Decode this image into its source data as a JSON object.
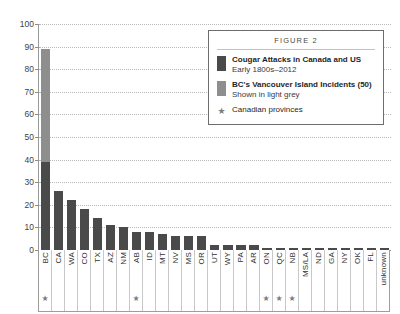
{
  "chart_data": {
    "type": "bar",
    "title": "",
    "xlabel": "",
    "ylabel": "",
    "ylim": [
      0,
      100
    ],
    "ytick_step": 10,
    "yticks": [
      0,
      10,
      20,
      30,
      40,
      50,
      60,
      70,
      80,
      90,
      100
    ],
    "grid": true,
    "legend_position": "upper-right",
    "categories": [
      "BC",
      "CA",
      "WA",
      "CO",
      "TX",
      "AZ",
      "NM",
      "AB",
      "ID",
      "MT",
      "NV",
      "MS",
      "OR",
      "UT",
      "WY",
      "PA",
      "AR",
      "ON",
      "QC",
      "NB",
      "MS/LA",
      "ND",
      "GA",
      "NY",
      "OK",
      "FL",
      "unknown"
    ],
    "values": [
      89,
      26,
      22,
      18,
      14,
      11,
      10,
      8,
      8,
      7,
      6,
      6,
      6,
      2,
      2,
      2,
      2,
      1,
      1,
      1,
      1,
      1,
      1,
      1,
      1,
      1,
      1
    ],
    "series": [
      {
        "name": "Cougar Attacks in Canada and US",
        "color": "#4a4a4a",
        "values": [
          39,
          26,
          22,
          18,
          14,
          11,
          10,
          8,
          8,
          7,
          6,
          6,
          6,
          2,
          2,
          2,
          2,
          1,
          1,
          1,
          1,
          1,
          1,
          1,
          1,
          1,
          1
        ]
      },
      {
        "name": "BC's Vancouver Island Incidents (50)",
        "color": "#8e8e8e",
        "values": [
          50,
          0,
          0,
          0,
          0,
          0,
          0,
          0,
          0,
          0,
          0,
          0,
          0,
          0,
          0,
          0,
          0,
          0,
          0,
          0,
          0,
          0,
          0,
          0,
          0,
          0,
          0
        ]
      }
    ],
    "starred_categories": [
      "BC",
      "AB",
      "ON",
      "QC",
      "NB"
    ],
    "star_glyph": "★",
    "annotations": []
  },
  "legend": {
    "title": "FIGURE 2",
    "entries": [
      {
        "swatch": "dark",
        "main": "Cougar Attacks in Canada and US",
        "sub": "Early 1800s–2012"
      },
      {
        "swatch": "light",
        "main": "BC's Vancouver Island Incidents (50)",
        "sub": "Shown in light grey"
      }
    ],
    "star_entry": {
      "glyph": "★",
      "label": "Canadian provinces"
    }
  },
  "colors": {
    "bar_dark": "#4a4a4a",
    "bar_light": "#8e8e8e",
    "gridline": "#b9b9b9",
    "axis": "#8d8d8d",
    "legend_border": "#6d6d6d",
    "text": "#2f2f2f"
  }
}
